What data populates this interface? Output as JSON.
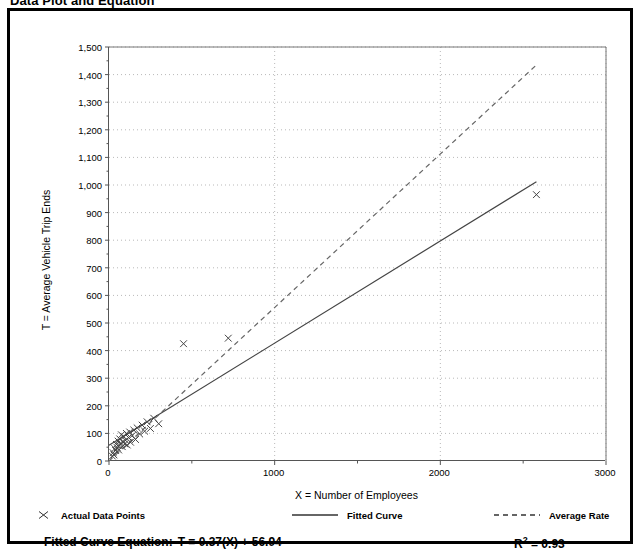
{
  "figure": {
    "title": "Data Plot and Equation"
  },
  "legend": {
    "position": "below-axis",
    "entries": [
      {
        "label": "Actual Data Points",
        "style": "marker-x",
        "icon": "cross-marker-icon"
      },
      {
        "label": "Fitted Curve",
        "style": "solid-line",
        "icon": "solid-line-icon"
      },
      {
        "label": "Average Rate",
        "style": "dashed-line",
        "icon": "dashed-line-icon"
      }
    ]
  },
  "equation": {
    "label": "Fitted Curve Equation:",
    "expression": "T = 0.37(X) + 56.94",
    "rsquared_symbol": "R",
    "rsquared_exponent": "2",
    "rsquared_value": "= 0.93"
  },
  "chart_data": {
    "type": "scatter",
    "title": "Data Plot and Equation",
    "xlabel": "X = Number of Employees",
    "ylabel": "T = Average Vehicle Trip Ends",
    "xlim": [
      0,
      3000
    ],
    "ylim": [
      0,
      1500
    ],
    "xticks": [
      0,
      1000,
      2000,
      3000
    ],
    "xtick_labels": [
      "0",
      "1000",
      "2000",
      "3000"
    ],
    "yticks": [
      0,
      100,
      200,
      300,
      400,
      500,
      600,
      700,
      800,
      900,
      1000,
      1100,
      1200,
      1300,
      1400,
      1500
    ],
    "ytick_labels": [
      "0",
      "100",
      "200",
      "300",
      "400",
      "500",
      "600",
      "700",
      "800",
      "900",
      "1,000",
      "1,100",
      "1,200",
      "1,300",
      "1,400",
      "1,500"
    ],
    "grid": true,
    "grid_style": "dotted",
    "series": [
      {
        "name": "Actual Data Points",
        "type": "scatter",
        "marker": "x",
        "color": "#444444",
        "points": [
          [
            20,
            18
          ],
          [
            25,
            30
          ],
          [
            30,
            22
          ],
          [
            35,
            45
          ],
          [
            40,
            38
          ],
          [
            45,
            60
          ],
          [
            50,
            48
          ],
          [
            55,
            72
          ],
          [
            58,
            40
          ],
          [
            62,
            55
          ],
          [
            65,
            80
          ],
          [
            70,
            65
          ],
          [
            75,
            95
          ],
          [
            80,
            52
          ],
          [
            85,
            70
          ],
          [
            90,
            88
          ],
          [
            95,
            62
          ],
          [
            100,
            75
          ],
          [
            105,
            100
          ],
          [
            110,
            58
          ],
          [
            118,
            85
          ],
          [
            125,
            105
          ],
          [
            130,
            68
          ],
          [
            140,
            92
          ],
          [
            150,
            112
          ],
          [
            160,
            78
          ],
          [
            170,
            120
          ],
          [
            185,
            98
          ],
          [
            200,
            130
          ],
          [
            215,
            108
          ],
          [
            230,
            142
          ],
          [
            250,
            118
          ],
          [
            270,
            155
          ],
          [
            300,
            135
          ],
          [
            450,
            425
          ],
          [
            720,
            445
          ],
          [
            2580,
            965
          ]
        ]
      },
      {
        "name": "Fitted Curve",
        "type": "line",
        "style": "solid",
        "color": "#444444",
        "equation": "T = 0.37(X) + 56.94",
        "slope": 0.37,
        "intercept": 56.94,
        "endpoints": [
          [
            0,
            57
          ],
          [
            2580,
            1012
          ]
        ]
      },
      {
        "name": "Average Rate",
        "type": "line",
        "style": "dashed",
        "color": "#666666",
        "slope": 0.556,
        "intercept": 0,
        "endpoints": [
          [
            0,
            0
          ],
          [
            2580,
            1435
          ]
        ]
      }
    ],
    "rsquared": 0.93
  },
  "axes": {
    "y_title": "T = Average Vehicle Trip Ends",
    "x_title": "X = Number of Employees"
  }
}
